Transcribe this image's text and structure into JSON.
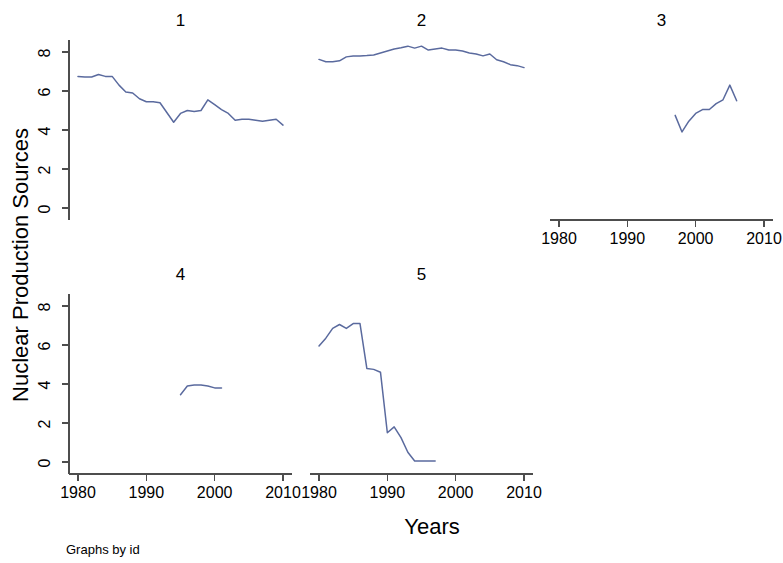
{
  "figure": {
    "background_color": "#ffffff",
    "axis_color": "#4d4d4d",
    "line_color": "#5a6a9e",
    "ylabel": "Nuclear Production Sources",
    "xlabel": "Years",
    "note": "Graphs by id"
  },
  "chart_data": {
    "type": "line",
    "title": "",
    "subtitle": "",
    "xlabel": "Years",
    "ylabel": "Nuclear Production Sources",
    "xlim": [
      1977,
      2012
    ],
    "ylim": [
      -0.6,
      9.0
    ],
    "xticks": [
      1980,
      1990,
      2000,
      2010
    ],
    "xtick_labels": [
      "1980",
      "1990",
      "2000",
      "2010"
    ],
    "yticks": [
      0,
      2,
      4,
      6,
      8
    ],
    "ytick_labels": [
      "0",
      "2",
      "4",
      "6",
      "8"
    ],
    "grid": false,
    "legend": "none",
    "small_multiples": true,
    "facet_by": "id",
    "layout": {
      "rows": 2,
      "cols": 3
    },
    "panels": [
      {
        "title": "1",
        "row": 0,
        "col": 0,
        "show_yaxis": true,
        "show_xaxis": false,
        "x": [
          1980,
          1981,
          1982,
          1983,
          1984,
          1985,
          1986,
          1987,
          1988,
          1989,
          1990,
          1991,
          1992,
          1993,
          1994,
          1995,
          1996,
          1997,
          1998,
          1999,
          2000,
          2001,
          2002,
          2003,
          2004,
          2005,
          2006,
          2007,
          2008,
          2009,
          2010
        ],
        "y": [
          6.75,
          6.72,
          6.72,
          6.85,
          6.75,
          6.75,
          6.3,
          5.95,
          5.9,
          5.6,
          5.45,
          5.45,
          5.4,
          4.9,
          4.4,
          4.85,
          5.0,
          4.95,
          5.0,
          5.55,
          5.3,
          5.05,
          4.85,
          4.5,
          4.55,
          4.55,
          4.5,
          4.45,
          4.5,
          4.55,
          4.25
        ]
      },
      {
        "title": "2",
        "row": 0,
        "col": 1,
        "show_yaxis": false,
        "show_xaxis": false,
        "x": [
          1980,
          1981,
          1982,
          1983,
          1984,
          1985,
          1986,
          1987,
          1988,
          1989,
          1990,
          1991,
          1992,
          1993,
          1994,
          1995,
          1996,
          1997,
          1998,
          1999,
          2000,
          2001,
          2002,
          2003,
          2004,
          2005,
          2006,
          2007,
          2008,
          2009,
          2010
        ],
        "y": [
          7.62,
          7.5,
          7.5,
          7.55,
          7.75,
          7.8,
          7.8,
          7.82,
          7.85,
          7.95,
          8.05,
          8.15,
          8.22,
          8.3,
          8.2,
          8.3,
          8.1,
          8.15,
          8.2,
          8.1,
          8.1,
          8.05,
          7.95,
          7.9,
          7.8,
          7.9,
          7.6,
          7.5,
          7.35,
          7.3,
          7.2
        ]
      },
      {
        "title": "3",
        "row": 0,
        "col": 2,
        "show_yaxis": false,
        "show_xaxis": true,
        "x": [
          1997,
          1998,
          1999,
          2000,
          2001,
          2002,
          2003,
          2004,
          2005,
          2006
        ],
        "y": [
          4.75,
          3.9,
          4.45,
          4.85,
          5.05,
          5.05,
          5.35,
          5.55,
          6.3,
          5.5
        ]
      },
      {
        "title": "4",
        "row": 1,
        "col": 0,
        "show_yaxis": true,
        "show_xaxis": true,
        "x": [
          1995,
          1996,
          1997,
          1998,
          1999,
          2000,
          2001
        ],
        "y": [
          3.45,
          3.9,
          3.95,
          3.95,
          3.9,
          3.8,
          3.8
        ]
      },
      {
        "title": "5",
        "row": 1,
        "col": 1,
        "show_yaxis": false,
        "show_xaxis": true,
        "x": [
          1980,
          1981,
          1982,
          1983,
          1984,
          1985,
          1986,
          1987,
          1988,
          1989,
          1990,
          1991,
          1992,
          1993,
          1994,
          1995,
          1996,
          1997
        ],
        "y": [
          5.95,
          6.35,
          6.85,
          7.05,
          6.85,
          7.1,
          7.1,
          4.8,
          4.75,
          4.6,
          1.5,
          1.8,
          1.25,
          0.5,
          0.05,
          0.05,
          0.05,
          0.05
        ]
      }
    ]
  }
}
